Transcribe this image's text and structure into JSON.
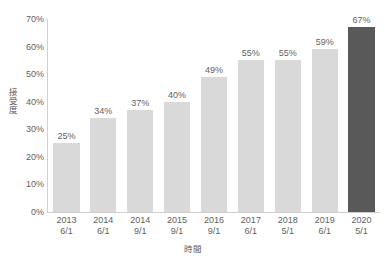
{
  "chart_data": {
    "type": "bar",
    "title": "",
    "subtitle": "",
    "xlabel": "時間",
    "ylabel": "接受度",
    "categories": [
      "2013\n6/1",
      "2014\n6/1",
      "2014\n9/1",
      "2015\n9/1",
      "2016\n9/1",
      "2017\n6/1",
      "2018\n5/1",
      "2019\n6/1",
      "2020\n5/1"
    ],
    "category_lines": [
      {
        "year": "2013",
        "date": "6/1"
      },
      {
        "year": "2014",
        "date": "6/1"
      },
      {
        "year": "2014",
        "date": "9/1"
      },
      {
        "year": "2015",
        "date": "9/1"
      },
      {
        "year": "2016",
        "date": "9/1"
      },
      {
        "year": "2017",
        "date": "6/1"
      },
      {
        "year": "2018",
        "date": "5/1"
      },
      {
        "year": "2019",
        "date": "6/1"
      },
      {
        "year": "2020",
        "date": "5/1"
      }
    ],
    "values": [
      25,
      34,
      37,
      40,
      49,
      55,
      55,
      59,
      67
    ],
    "data_labels": [
      "25%",
      "34%",
      "37%",
      "40%",
      "49%",
      "55%",
      "55%",
      "59%",
      "67%"
    ],
    "ylim": [
      0,
      70
    ],
    "ytick_values": [
      0,
      10,
      20,
      30,
      40,
      50,
      60,
      70
    ],
    "ytick_labels": [
      "0%",
      "10%",
      "20%",
      "30%",
      "40%",
      "50%",
      "60%",
      "70%"
    ],
    "grid": false,
    "legend": null,
    "bar_color": "#d9d9d9",
    "highlight_color": "#595959",
    "highlight_index": 8,
    "text_color": "#5f5f5f",
    "axis_color": "#d0d0d0",
    "background": "#ffffff"
  }
}
